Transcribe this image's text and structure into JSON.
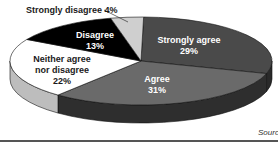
{
  "chart_data": {
    "type": "pie",
    "style": "3d-exploded-none",
    "title": "",
    "categories": [
      "Strongly agree",
      "Agree",
      "Neither agree nor disagree",
      "Disagree",
      "Strongly disagree"
    ],
    "values": [
      29,
      31,
      22,
      13,
      4
    ],
    "unit": "%",
    "colors": [
      "#4a4a4a",
      "#6a6a6a",
      "#ffffff",
      "#000000",
      "#cfcfcf"
    ],
    "side_colors": [
      "#2a2a2a",
      "#2e2e2e",
      "#bdbdbd",
      "#111111",
      "#9a9a9a"
    ],
    "labels": [
      {
        "line1": "Strongly agree",
        "line2": "29%"
      },
      {
        "line1": "Agree",
        "line2": "31%"
      },
      {
        "line1": "Neither agree",
        "line2": "nor disagree",
        "line3": "22%"
      },
      {
        "line1": "Disagree",
        "line2": "13%"
      },
      {
        "line1": "Strongly disagree 4%"
      }
    ],
    "legend": "none (inline labels)",
    "source_text": "Sourc"
  }
}
